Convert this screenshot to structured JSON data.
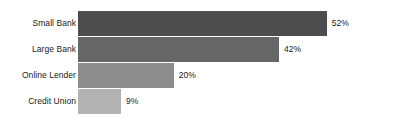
{
  "chart_data": {
    "type": "bar",
    "orientation": "horizontal",
    "title": "",
    "subtitle": "",
    "xlabel": "",
    "ylabel": "",
    "categories": [
      "Small Bank",
      "Large Bank",
      "Online Lender",
      "Credit Union"
    ],
    "values": [
      52,
      42,
      20,
      9
    ],
    "value_labels": [
      "52%",
      "42%",
      "20%",
      "9%"
    ],
    "unit": "%",
    "xlim": [
      0,
      70
    ],
    "grid": false,
    "legend": "none",
    "axis_visible": false,
    "bar_colors": [
      "#4d4d4d",
      "#666666",
      "#8c8c8c",
      "#b3b3b3"
    ],
    "background_color": "#ffffff",
    "text_color": "#1a1a1a",
    "series": [
      {
        "name": "Share",
        "values": [
          52,
          42,
          20,
          9
        ]
      }
    ],
    "points": [
      {
        "category": "Small Bank",
        "value": 52,
        "label": "52%",
        "color": "#4d4d4d"
      },
      {
        "category": "Large Bank",
        "value": 42,
        "label": "42%",
        "color": "#666666"
      },
      {
        "category": "Online Lender",
        "value": 20,
        "label": "20%",
        "color": "#8c8c8c"
      },
      {
        "category": "Credit Union",
        "value": 9,
        "label": "9%",
        "color": "#b3b3b3"
      }
    ]
  }
}
